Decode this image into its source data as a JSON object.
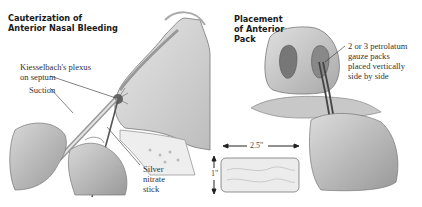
{
  "left_panel": {
    "title_line1": "Cauterization of",
    "title_line2": "Anterior Nasal Bleeding",
    "labels": {
      "plexus_line1": "Kiesselbach's plexus",
      "plexus_line2": "on septum",
      "suction": "Suction",
      "silver_line1": "Silver",
      "silver_line2": "nitrate",
      "silver_line3": "stick"
    }
  },
  "right_panel": {
    "title_line1": "Placement",
    "title_line2": "of Anterior",
    "title_line3": "Pack",
    "labels": {
      "gauze_line1": "2 or 3 petrolatum",
      "gauze_line2": "gauze packs",
      "gauze_line3": "placed vertically",
      "gauze_line4": "side by side"
    },
    "dimensions": {
      "width": "2.5\"",
      "height": "1\""
    }
  },
  "colors": {
    "ink": "#1a1a1a",
    "tissue": "#c9c9c9",
    "bone": "#e4e4e4",
    "shadow": "#8a8a8a"
  }
}
